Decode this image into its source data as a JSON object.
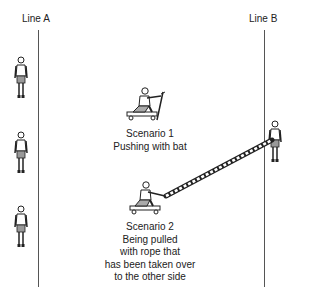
{
  "diagram": {
    "line_a": {
      "label": "Line A"
    },
    "line_b": {
      "label": "Line B"
    },
    "scenario_1": {
      "lines": [
        "Scenario 1",
        "Pushing with bat"
      ]
    },
    "scenario_2": {
      "lines": [
        "Scenario 2",
        "Being pulled",
        "with rope that",
        "has been taken over",
        "to the other side"
      ]
    },
    "figures": {
      "line_a_people_count": 3,
      "line_b_people_count": 1
    },
    "colors": {
      "line": "#555555",
      "ink": "#222222",
      "background": "#ffffff"
    }
  }
}
